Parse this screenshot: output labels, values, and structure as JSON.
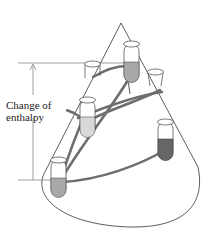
{
  "diagram": {
    "type": "cone-enthalpy-paths",
    "label": {
      "line1": "Change of",
      "line2": "enthalpy"
    },
    "colors": {
      "outline": "#333333",
      "path": "#6e6e6e",
      "liquid_light": "#d8d8d8",
      "liquid_mid": "#a8a8a8",
      "liquid_dark": "#666666",
      "reference_line": "#777777"
    },
    "tubes": [
      {
        "name": "start-tube",
        "position": "bottom-left",
        "fill": "mid"
      },
      {
        "name": "middle-left-tube",
        "position": "middle-left",
        "fill": "light"
      },
      {
        "name": "upper-left-tube",
        "position": "upper-left",
        "fill": "none"
      },
      {
        "name": "end-tube",
        "position": "top-center",
        "fill": "mid"
      },
      {
        "name": "upper-right-tube",
        "position": "upper-right",
        "fill": "none"
      },
      {
        "name": "lower-right-tube",
        "position": "lower-right",
        "fill": "dark"
      }
    ],
    "paths_count": 4
  }
}
